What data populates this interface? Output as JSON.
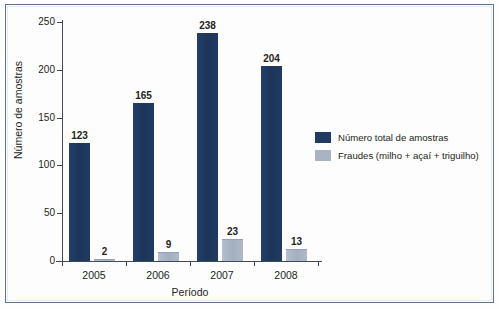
{
  "chart_data": {
    "type": "bar",
    "title": "",
    "xlabel": "Período",
    "ylabel": "Número de amostras",
    "categories": [
      "2005",
      "2006",
      "2007",
      "2008"
    ],
    "series": [
      {
        "name": "Número total de amostras",
        "color": "#1F3A63",
        "values": [
          123,
          165,
          238,
          204
        ]
      },
      {
        "name": "Fraudes (milho + açaí + triguilho)",
        "color": "#A8B4C4",
        "values": [
          2,
          9,
          23,
          13
        ]
      }
    ],
    "ylim": [
      0,
      250
    ],
    "yticks": [
      0,
      50,
      100,
      150,
      200,
      250
    ],
    "ytick_labels": [
      "0",
      "50",
      "100",
      "150",
      "200",
      "250"
    ],
    "grid": false,
    "legend_position": "center-right",
    "data_labels": true
  },
  "legend": {
    "entries": [
      {
        "label": "Número total de amostras"
      },
      {
        "label": "Fraudes (milho + açaí + triguilho)"
      }
    ]
  },
  "axes": {
    "y_title": "Número de amostras",
    "x_title": "Período"
  }
}
